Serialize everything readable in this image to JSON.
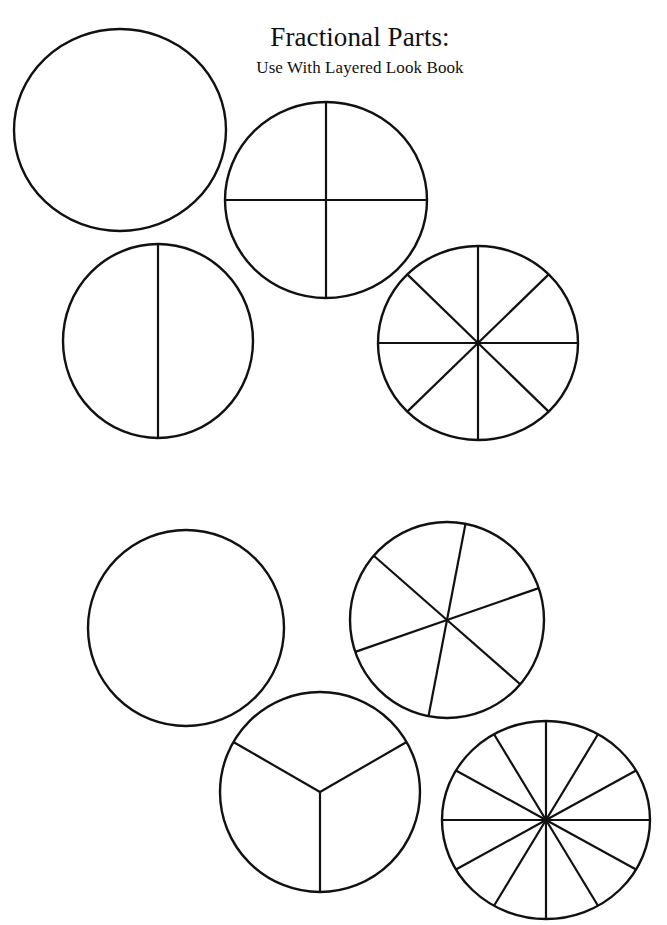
{
  "page": {
    "width": 667,
    "height": 925,
    "background_color": "#ffffff",
    "ink_color": "#111111"
  },
  "header": {
    "title": "Fractional Parts:",
    "subtitle": "Use With Layered Look Book"
  },
  "chart_data": {
    "type": "pie",
    "title": "Fractional Parts:",
    "subtitle": "Use With Layered Look Book",
    "grid": false,
    "legend": false,
    "shapes": [
      {
        "id": "circle-whole-top",
        "name": "whole-circle",
        "fraction_label": "1 whole",
        "parts": 1,
        "slice_value": 1,
        "values": [
          1
        ],
        "cx": 120,
        "cy": 130,
        "rx": 106,
        "ry": 101,
        "rotation_deg": 0,
        "row": "top",
        "position": "top-left"
      },
      {
        "id": "circle-fourths",
        "name": "fourths-circle",
        "fraction_label": "1/4",
        "parts": 4,
        "slice_value": 0.25,
        "values": [
          0.25,
          0.25,
          0.25,
          0.25
        ],
        "cx": 326,
        "cy": 200,
        "rx": 101,
        "ry": 98,
        "rotation_deg": 0,
        "row": "top",
        "position": "top-right"
      },
      {
        "id": "circle-halves",
        "name": "halves-circle",
        "fraction_label": "1/2",
        "parts": 2,
        "slice_value": 0.5,
        "values": [
          0.5,
          0.5
        ],
        "cx": 158,
        "cy": 341,
        "rx": 95,
        "ry": 97,
        "rotation_deg": 0,
        "row": "top",
        "position": "mid-left"
      },
      {
        "id": "circle-eighths",
        "name": "eighths-circle",
        "fraction_label": "1/8",
        "parts": 8,
        "slice_value": 0.125,
        "values": [
          0.125,
          0.125,
          0.125,
          0.125,
          0.125,
          0.125,
          0.125,
          0.125
        ],
        "cx": 478,
        "cy": 343,
        "rx": 100,
        "ry": 97,
        "rotation_deg": 0,
        "row": "top",
        "position": "mid-right"
      },
      {
        "id": "circle-whole-bottom",
        "name": "whole-circle",
        "fraction_label": "1 whole",
        "parts": 1,
        "slice_value": 1,
        "values": [
          1
        ],
        "cx": 186,
        "cy": 628,
        "rx": 98,
        "ry": 98,
        "rotation_deg": 0,
        "row": "bottom",
        "position": "bottom-left"
      },
      {
        "id": "circle-sixths",
        "name": "sixths-circle",
        "fraction_label": "1/6",
        "parts": 6,
        "slice_value": 0.1667,
        "values": [
          0.1667,
          0.1667,
          0.1667,
          0.1667,
          0.1667,
          0.1667
        ],
        "cx": 447,
        "cy": 620,
        "rx": 97,
        "ry": 98,
        "rotation_deg": -11,
        "row": "bottom",
        "position": "bottom-right"
      },
      {
        "id": "circle-thirds",
        "name": "thirds-circle",
        "fraction_label": "1/3",
        "parts": 3,
        "slice_value": 0.3333,
        "values": [
          0.3333,
          0.3333,
          0.3333
        ],
        "cx": 320,
        "cy": 792,
        "rx": 100,
        "ry": 100,
        "rotation_deg": 0,
        "row": "bottom",
        "position": "lower-mid"
      },
      {
        "id": "circle-twelfths",
        "name": "twelfths-circle",
        "fraction_label": "1/12",
        "parts": 12,
        "slice_value": 0.0833,
        "values": [
          0.0833,
          0.0833,
          0.0833,
          0.0833,
          0.0833,
          0.0833,
          0.0833,
          0.0833,
          0.0833,
          0.0833,
          0.0833,
          0.0833
        ],
        "cx": 546,
        "cy": 820,
        "rx": 104,
        "ry": 99,
        "rotation_deg": 0,
        "row": "bottom",
        "position": "lower-right"
      }
    ]
  }
}
